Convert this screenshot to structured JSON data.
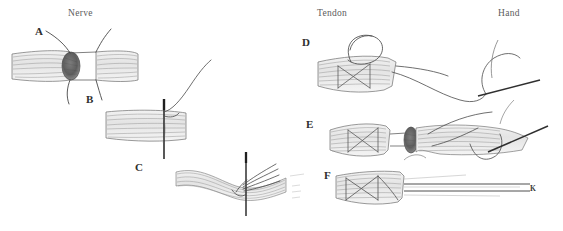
{
  "figure": {
    "type": "hand-drawn surgical illustration",
    "width": 563,
    "height": 231,
    "background_color": "#ffffff",
    "ink_color": "#555555",
    "accent_dark": "#3a3a3a",
    "tissue_fill": "#e9e9e9"
  },
  "anatomical_labels": {
    "nerve": "Nerve",
    "tendon": "Tendon",
    "hand": "Hand"
  },
  "panels": [
    {
      "letter": "A",
      "region": "nerve",
      "description": "Two transected nerve ends separated by a dark oval neuroma stump with epineurial suture threads curving above and below"
    },
    {
      "letter": "B",
      "region": "nerve",
      "description": "Nerve segment pierced vertically by a straight needle with suture thread curving up to the right"
    },
    {
      "letter": "C",
      "region": "nerve",
      "description": "Splayed nerve fascicles gathered around a vertical needle with multiple converging suture strands"
    },
    {
      "letter": "D",
      "region": "tendon",
      "description": "Tendon end with criss-cross core suture and a looped thread above, trailing suture running toward the hand with a straight needle"
    },
    {
      "letter": "E",
      "region": "tendon",
      "description": "Tendon with criss-cross core suture bridged by thin strands to a dark oval cut surface and a second tendon segment, with needle and thread at right"
    },
    {
      "letter": "F",
      "region": "tendon",
      "description": "Tendon with criss-cross core suture and long parallel strands extending to the right, terminating at marker K"
    }
  ],
  "markers": {
    "k": "K"
  }
}
